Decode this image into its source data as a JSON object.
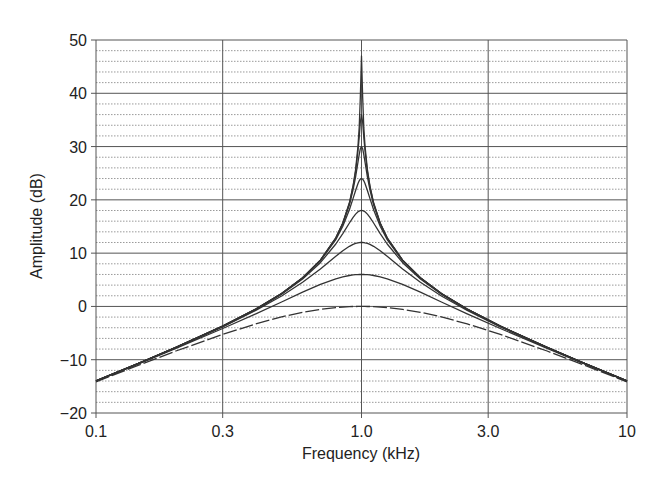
{
  "chart_data": {
    "type": "line",
    "title": "",
    "xlabel": "Frequency (kHz)",
    "ylabel": "Amplitude (dB)",
    "xscale": "log",
    "xlim": [
      0.1,
      10
    ],
    "ylim": [
      -20,
      50
    ],
    "x_ticks": [
      0.1,
      0.3,
      1.0,
      3.0,
      10
    ],
    "x_tick_labels": [
      "0.1",
      "0.3",
      "1.0",
      "3.0",
      "10"
    ],
    "y_ticks": [
      50,
      40,
      30,
      20,
      10,
      0,
      -10,
      -20
    ],
    "y_tick_labels": [
      "50",
      "40",
      "30",
      "20",
      "10",
      "0",
      "−10",
      "−20"
    ],
    "y_minor_step": 2,
    "grid": true,
    "legend": null,
    "x": [
      0.1,
      0.15,
      0.2,
      0.3,
      0.4,
      0.5,
      0.6,
      0.7,
      0.8,
      0.85,
      0.9,
      0.93,
      0.95,
      0.97,
      0.98,
      0.99,
      1.0,
      1.0101,
      1.0204,
      1.0309,
      1.0526,
      1.0753,
      1.1111,
      1.1765,
      1.25,
      1.4286,
      1.6667,
      2.0,
      2.5,
      3.3333,
      5.0,
      6.6667,
      10.0
    ],
    "series": [
      {
        "name": "peak 0 dB",
        "dashed": true,
        "values": [
          -14.15,
          -10.73,
          -8.37,
          -5.25,
          -3.27,
          -1.97,
          -1.11,
          -0.55,
          -0.22,
          -0.12,
          -0.05,
          -0.02,
          -0.01,
          0.0,
          0.0,
          0.0,
          0.0,
          0.0,
          0.0,
          0.0,
          -0.01,
          -0.02,
          -0.05,
          -0.12,
          -0.22,
          -0.55,
          -1.11,
          -1.97,
          -3.27,
          -5.25,
          -8.37,
          -10.73,
          -14.15
        ]
      },
      {
        "name": "peak 6 dB",
        "dashed": false,
        "values": [
          -14.02,
          -10.45,
          -7.87,
          -4.14,
          -1.39,
          0.84,
          2.67,
          4.13,
          5.19,
          5.55,
          5.81,
          5.91,
          5.95,
          5.98,
          5.99,
          6.0,
          6.0,
          6.0,
          5.99,
          5.98,
          5.95,
          5.91,
          5.81,
          5.55,
          5.19,
          4.13,
          2.67,
          0.84,
          -1.39,
          -4.14,
          -7.87,
          -10.45,
          -14.02
        ]
      },
      {
        "name": "peak 12 dB",
        "dashed": false,
        "values": [
          -13.99,
          -10.37,
          -7.74,
          -3.82,
          -0.75,
          1.96,
          4.52,
          7.02,
          9.4,
          10.44,
          11.28,
          11.64,
          11.82,
          11.93,
          11.97,
          11.99,
          12.0,
          11.99,
          11.97,
          11.93,
          11.82,
          11.64,
          11.28,
          10.44,
          9.4,
          7.02,
          4.52,
          1.96,
          -0.75,
          -3.82,
          -7.74,
          -10.37,
          -13.99
        ]
      },
      {
        "name": "peak 18 dB",
        "dashed": false,
        "values": [
          -13.98,
          -10.35,
          -7.7,
          -3.73,
          -0.57,
          2.29,
          5.14,
          8.2,
          11.71,
          13.66,
          15.65,
          16.73,
          17.32,
          17.75,
          17.89,
          17.97,
          18.0,
          17.97,
          17.89,
          17.75,
          17.32,
          16.73,
          15.65,
          13.66,
          11.71,
          8.2,
          5.14,
          2.29,
          -0.57,
          -3.73,
          -7.7,
          -10.35,
          -13.98
        ]
      },
      {
        "name": "peak 24 dB",
        "dashed": false,
        "values": [
          -13.98,
          -10.35,
          -7.69,
          -3.71,
          -0.53,
          2.38,
          5.31,
          8.56,
          12.55,
          15.06,
          18.14,
          20.28,
          21.76,
          23.07,
          23.57,
          23.89,
          24.0,
          23.89,
          23.57,
          23.07,
          21.76,
          20.28,
          18.14,
          15.06,
          12.55,
          8.56,
          5.31,
          2.38,
          -0.53,
          -3.71,
          -7.69,
          -10.35,
          -13.98
        ]
      },
      {
        "name": "peak 30 dB",
        "dashed": false,
        "values": [
          -13.98,
          -10.35,
          -7.69,
          -3.71,
          -0.51,
          2.41,
          5.36,
          8.65,
          12.79,
          15.5,
          19.08,
          21.95,
          24.33,
          27.11,
          28.49,
          29.57,
          30.0,
          29.57,
          28.49,
          27.11,
          24.33,
          21.95,
          19.08,
          15.5,
          12.79,
          8.65,
          5.36,
          2.41,
          -0.51,
          -3.71,
          -7.69,
          -10.35,
          -13.98
        ]
      },
      {
        "name": "peak 36 dB",
        "dashed": false,
        "values": [
          -13.98,
          -10.35,
          -7.69,
          -3.7,
          -0.51,
          2.41,
          5.37,
          8.67,
          12.85,
          15.62,
          19.35,
          22.49,
          25.32,
          29.22,
          31.76,
          34.51,
          36.0,
          34.51,
          31.76,
          29.22,
          25.32,
          22.49,
          19.35,
          15.62,
          12.85,
          8.67,
          5.37,
          2.41,
          -0.51,
          -3.7,
          -7.69,
          -10.35,
          -13.98
        ]
      },
      {
        "name": "peak 47 dB",
        "dashed": false,
        "values": [
          -13.98,
          -10.35,
          -7.69,
          -3.7,
          -0.51,
          2.41,
          5.37,
          8.68,
          12.87,
          15.65,
          19.44,
          22.67,
          25.68,
          30.15,
          33.6,
          39.1,
          47.0,
          39.1,
          33.6,
          30.15,
          25.68,
          22.67,
          19.44,
          15.65,
          12.87,
          8.68,
          5.37,
          2.41,
          -0.51,
          -3.7,
          -7.69,
          -10.35,
          -13.98
        ]
      }
    ]
  },
  "colors": {
    "curve": "#333333",
    "major_grid": "#555555",
    "minor_grid": "#9a9a9a",
    "text": "#222222",
    "background": "#ffffff"
  },
  "plot_box": {
    "left": 96,
    "right": 627,
    "top": 40,
    "bottom": 413
  }
}
